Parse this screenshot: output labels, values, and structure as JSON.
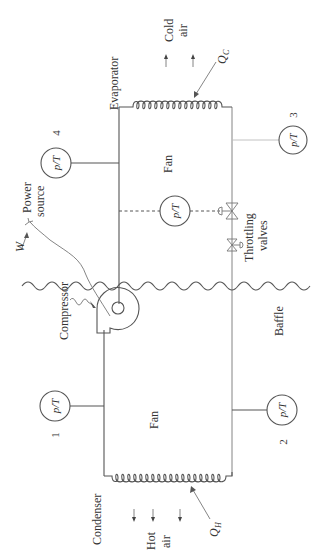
{
  "figure": {
    "labels": {
      "evaporator": "Evaporator",
      "condenser": "Condenser",
      "compressor": "Compressor",
      "power_source_line1": "Power",
      "power_source_line2": "source",
      "work": "W",
      "throttling_line1": "Throttling",
      "throttling_line2": "valves",
      "baffle": "Baffle",
      "fan_top": "Fan",
      "fan_bottom": "Fan",
      "cold_air_line1": "Cold",
      "cold_air_line2": "air",
      "hot_air_line1": "Hot",
      "hot_air_line2": "air",
      "qc_main": "Q",
      "qc_sub": "C",
      "qh_main": "Q",
      "qh_sub": "H"
    },
    "sensors": [
      {
        "id": "sensor-4",
        "label": "p/T",
        "station": "4"
      },
      {
        "id": "sensor-3",
        "label": "p/T",
        "station": "3"
      },
      {
        "id": "sensor-mid",
        "label": "p/T",
        "station": ""
      },
      {
        "id": "sensor-1",
        "label": "p/T",
        "station": "1"
      },
      {
        "id": "sensor-2",
        "label": "p/T",
        "station": "2"
      }
    ],
    "colors": {
      "line": "#555555",
      "text": "#333333",
      "background": "#ffffff"
    }
  }
}
